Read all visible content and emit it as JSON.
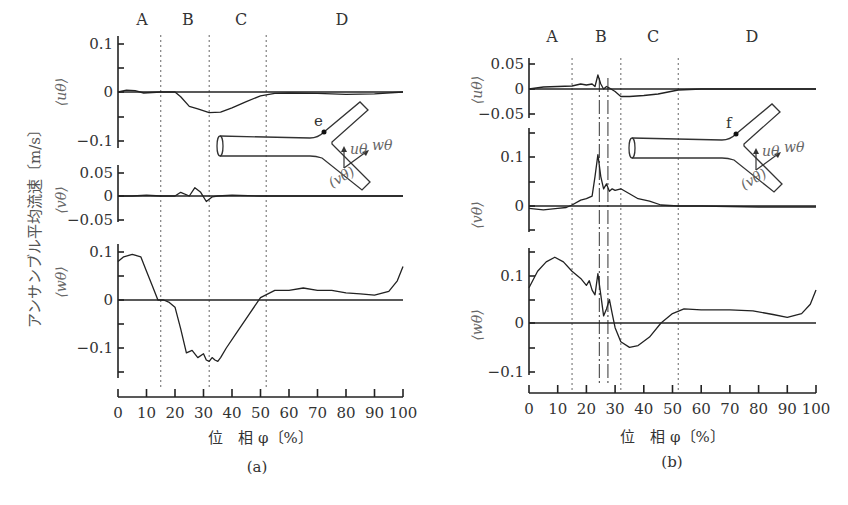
{
  "chart_data": [
    {
      "id": "a",
      "type": "line",
      "caption": "(a)",
      "xlabel": "位　相 φ〔%〕",
      "ylabel": "アンサンブル平均流速〔m/s〕",
      "x_ticks": [
        "0",
        "10",
        "20",
        "30",
        "40",
        "50",
        "60",
        "70",
        "80",
        "90",
        "100"
      ],
      "xlim": [
        0,
        100
      ],
      "regions": [
        "A",
        "B",
        "C",
        "D"
      ],
      "region_boundaries_dashed": [
        15,
        32,
        52
      ],
      "diagram_point": "e",
      "diagram_labels": {
        "u": "uθ",
        "w": "wθ",
        "v": "(vθ)"
      },
      "subplots": [
        {
          "name": "⟨uθ⟩",
          "yticks": [
            "0.1",
            "0",
            "−0.1"
          ],
          "ylim": [
            -0.1,
            0.1
          ],
          "x": [
            0,
            3,
            6,
            9,
            12,
            15,
            20,
            22,
            25,
            28,
            32,
            36,
            40,
            45,
            50,
            55,
            60,
            70,
            80,
            90,
            100
          ],
          "y": [
            0,
            0.004,
            0.003,
            -0.002,
            -0.001,
            0,
            0,
            -0.01,
            -0.03,
            -0.035,
            -0.043,
            -0.042,
            -0.033,
            -0.02,
            -0.008,
            -0.003,
            -0.002,
            -0.003,
            -0.005,
            -0.004,
            0
          ]
        },
        {
          "name": "⟨vθ⟩",
          "yticks": [
            "0.05",
            "0",
            "−0.05"
          ],
          "ylim": [
            -0.05,
            0.05
          ],
          "x": [
            0,
            5,
            10,
            15,
            20,
            22,
            25,
            27,
            29,
            31,
            33,
            35,
            40,
            50,
            60,
            70,
            80,
            90,
            100
          ],
          "y": [
            0,
            0,
            0.002,
            0,
            0,
            0.008,
            0,
            0.018,
            0.008,
            -0.012,
            -0.002,
            0,
            0.002,
            0,
            0,
            0,
            0,
            0,
            0
          ]
        },
        {
          "name": "⟨wθ⟩",
          "yticks": [
            "0.1",
            "0",
            "−0.1"
          ],
          "ylim": [
            -0.15,
            0.12
          ],
          "x": [
            0,
            2,
            5,
            8,
            10,
            12,
            14,
            16,
            18,
            20,
            22,
            24,
            26,
            28,
            30,
            31,
            32,
            33,
            34,
            35,
            36,
            38,
            42,
            46,
            50,
            55,
            60,
            65,
            70,
            75,
            80,
            85,
            90,
            95,
            98,
            100
          ],
          "y": [
            0.08,
            0.09,
            0.095,
            0.09,
            0.06,
            0.03,
            0.0,
            0.0,
            -0.005,
            -0.015,
            -0.06,
            -0.11,
            -0.105,
            -0.12,
            -0.112,
            -0.125,
            -0.128,
            -0.12,
            -0.125,
            -0.128,
            -0.12,
            -0.1,
            -0.065,
            -0.03,
            0.005,
            0.02,
            0.02,
            0.025,
            0.02,
            0.02,
            0.015,
            0.013,
            0.01,
            0.018,
            0.04,
            0.07
          ]
        }
      ]
    },
    {
      "id": "b",
      "type": "line",
      "caption": "(b)",
      "xlabel": "位　相 φ〔%〕",
      "x_ticks": [
        "0",
        "10",
        "20",
        "30",
        "40",
        "50",
        "60",
        "70",
        "80",
        "90",
        "100"
      ],
      "xlim": [
        0,
        100
      ],
      "regions": [
        "A",
        "B",
        "C",
        "D"
      ],
      "region_boundaries_dashed": [
        15,
        32,
        52
      ],
      "region_boundaries_dashdot": [
        24.5,
        27.5
      ],
      "diagram_point": "f",
      "diagram_labels": {
        "u": "uθ",
        "w": "wθ",
        "v": "(vθ)"
      },
      "subplots": [
        {
          "name": "⟨uθ⟩",
          "yticks": [
            "0.05",
            "0",
            "−0.05"
          ],
          "ylim": [
            -0.05,
            0.05
          ],
          "x": [
            0,
            5,
            10,
            15,
            18,
            20,
            22,
            23,
            24,
            25,
            26,
            27,
            28,
            30,
            32,
            35,
            40,
            45,
            52,
            60,
            80,
            100
          ],
          "y": [
            0,
            0.004,
            0.005,
            0.006,
            0.01,
            0.008,
            0.01,
            0.005,
            0.028,
            0.01,
            0.0,
            0.005,
            0.002,
            -0.005,
            -0.015,
            -0.015,
            -0.013,
            -0.01,
            -0.002,
            0,
            0,
            0
          ]
        },
        {
          "name": "⟨vθ⟩",
          "yticks": [
            "0.1",
            "0"
          ],
          "ylim": [
            -0.04,
            0.16
          ],
          "x": [
            0,
            5,
            10,
            13,
            15,
            18,
            20,
            22,
            23,
            24,
            25,
            26,
            27,
            28,
            29,
            30,
            32,
            35,
            38,
            42,
            46,
            52,
            60,
            80,
            100
          ],
          "y": [
            -0.005,
            -0.008,
            -0.005,
            -0.003,
            0.002,
            0.012,
            0.015,
            0.02,
            0.06,
            0.105,
            0.06,
            0.035,
            0.045,
            0.03,
            0.035,
            0.032,
            0.035,
            0.025,
            0.015,
            0.01,
            0.002,
            0,
            0,
            -0.002,
            -0.002
          ]
        },
        {
          "name": "⟨wθ⟩",
          "yticks": [
            "0.1",
            "0",
            "−0.1"
          ],
          "ylim": [
            -0.13,
            0.16
          ],
          "x": [
            0,
            3,
            6,
            9,
            12,
            15,
            18,
            20,
            21,
            22,
            23,
            24,
            25,
            26,
            27,
            28,
            29,
            30,
            32,
            35,
            38,
            42,
            46,
            50,
            54,
            60,
            70,
            78,
            85,
            90,
            95,
            98,
            100
          ],
          "y": [
            0.075,
            0.11,
            0.13,
            0.14,
            0.13,
            0.11,
            0.095,
            0.08,
            0.09,
            0.07,
            0.06,
            0.105,
            0.06,
            0.015,
            0.03,
            0.05,
            0.02,
            -0.01,
            -0.04,
            -0.052,
            -0.048,
            -0.03,
            0.0,
            0.02,
            0.03,
            0.028,
            0.028,
            0.026,
            0.018,
            0.012,
            0.02,
            0.04,
            0.07
          ]
        }
      ]
    }
  ]
}
